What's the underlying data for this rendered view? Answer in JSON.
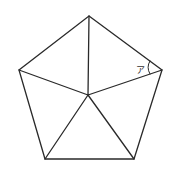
{
  "diagram": {
    "type": "geometry",
    "shape": "regular pentagon divided into 5 triangles from an interior point",
    "vertices": {
      "top": [
        89,
        16
      ],
      "right": [
        162,
        70
      ],
      "bottom_right": [
        134,
        159
      ],
      "bottom_left": [
        45,
        159
      ],
      "left": [
        19,
        70
      ],
      "center": [
        88,
        95
      ]
    },
    "angle_label": "ア",
    "colors": {
      "stroke": "#2a2a2a",
      "background": "#ffffff"
    }
  }
}
